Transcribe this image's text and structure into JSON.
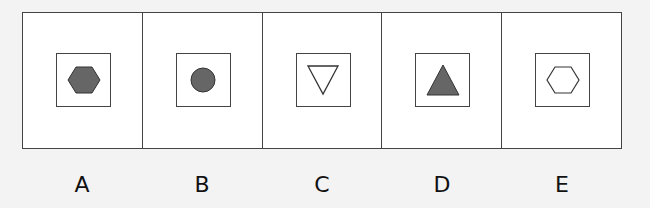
{
  "options": [
    {
      "label": "A",
      "shape": "hexagon",
      "fill": "#666666"
    },
    {
      "label": "B",
      "shape": "circle",
      "fill": "#666666"
    },
    {
      "label": "C",
      "shape": "triangle-down",
      "fill": "none"
    },
    {
      "label": "D",
      "shape": "triangle-up",
      "fill": "#666666"
    },
    {
      "label": "E",
      "shape": "hexagon",
      "fill": "none"
    }
  ],
  "colors": {
    "stroke": "#333333",
    "shape_fill": "#666666",
    "background": "#f3f3f3"
  }
}
